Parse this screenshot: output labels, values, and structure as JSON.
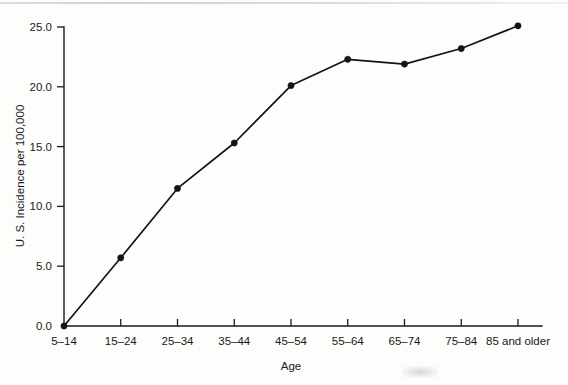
{
  "chart_data": {
    "type": "line",
    "title": "",
    "xlabel": "Age",
    "ylabel": "U. S. Incidence per 100,000",
    "categories": [
      "5–14",
      "15–24",
      "25–34",
      "35–44",
      "45–54",
      "55–64",
      "65–74",
      "75–84",
      "85 and older"
    ],
    "values": [
      0.0,
      5.7,
      11.5,
      15.3,
      20.1,
      22.3,
      21.9,
      23.2,
      25.1
    ],
    "ylim": [
      0.0,
      25.0
    ],
    "ytick_labels": [
      "25.0",
      "20.0",
      "15.0",
      "10.0",
      "5.0",
      "0.0"
    ],
    "ytick_values": [
      25.0,
      20.0,
      15.0,
      10.0,
      5.0,
      0.0
    ],
    "grid": false,
    "legend": false,
    "marker": "filled-circle",
    "line_color": "#141414",
    "background_color": "#fdfdfb"
  },
  "axes": {
    "y_title": "U. S. Incidence per 100,000",
    "x_title": "Age"
  }
}
